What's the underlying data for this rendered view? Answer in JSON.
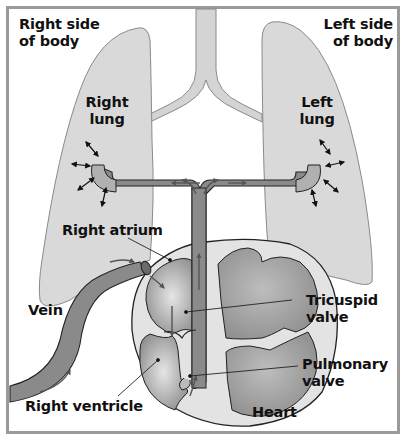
{
  "diagram": {
    "labels": {
      "right_side": "Right side\nof body",
      "left_side": "Left side\nof body",
      "right_lung": "Right\nlung",
      "left_lung": "Left\nlung",
      "right_atrium": "Right atrium",
      "vein": "Vein",
      "tricuspid_valve": "Tricuspid\nvalve",
      "pulmonary_valve": "Pulmonary\nvalve",
      "right_ventricle": "Right ventricle",
      "heart": "Heart"
    },
    "colors": {
      "lung_fill": "#d9d9d9",
      "vessel_fill": "#8a8a8a",
      "heart_wall": "#e3e3e3",
      "chamber_fill": "#9c9c9c",
      "outline": "#222222",
      "frame": "#9a9a9a",
      "text": "#111111"
    },
    "nodes": [
      "Vein",
      "Right atrium",
      "Tricuspid valve",
      "Right ventricle",
      "Pulmonary valve",
      "Pulmonary artery",
      "Right lung",
      "Left lung"
    ],
    "edges": [
      {
        "from": "Vein",
        "to": "Right atrium"
      },
      {
        "from": "Right atrium",
        "to": "Right ventricle",
        "via": "Tricuspid valve"
      },
      {
        "from": "Right ventricle",
        "to": "Pulmonary artery",
        "via": "Pulmonary valve"
      },
      {
        "from": "Pulmonary artery",
        "to": "Right lung"
      },
      {
        "from": "Pulmonary artery",
        "to": "Left lung"
      }
    ]
  }
}
